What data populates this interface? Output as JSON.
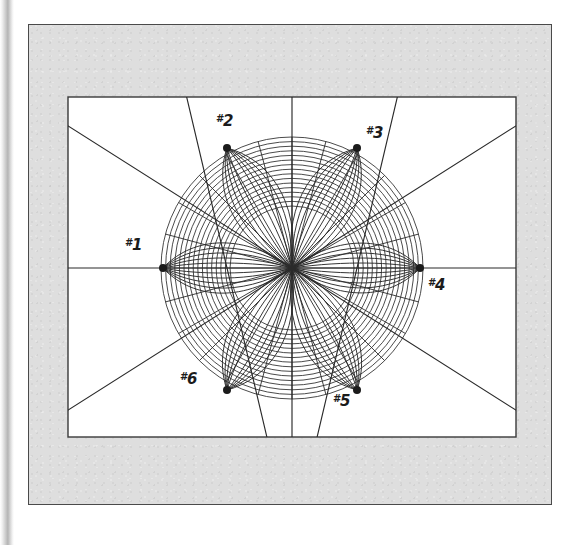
{
  "document": {
    "kind": "scanned-figure-plate",
    "background_color": "#ffffff",
    "plate_color": "#dedede",
    "canvas_color": "#ffffff",
    "ink_color": "#2a2a2a"
  },
  "plate": {
    "frame_label": "outer-plate-frame",
    "canvas_label": "figure-canvas"
  },
  "labels": [
    {
      "id": "n1",
      "hash": "#",
      "num": "1",
      "text": "#1"
    },
    {
      "id": "n2",
      "hash": "#",
      "num": "2",
      "text": "#2"
    },
    {
      "id": "n3",
      "hash": "#",
      "num": "3",
      "text": "#3"
    },
    {
      "id": "n4",
      "hash": "#",
      "num": "4",
      "text": "#4"
    },
    {
      "id": "n5",
      "hash": "#",
      "num": "5",
      "text": "#5"
    },
    {
      "id": "n6",
      "hash": "#",
      "num": "6",
      "text": "#6"
    }
  ],
  "chart_data": {
    "type": "scatter",
    "title": "",
    "xlabel": "",
    "ylabel": "",
    "grid": false,
    "legend": null,
    "center": {
      "x": 292,
      "y": 268
    },
    "inner_radius": 62,
    "outer_radius": 131,
    "ring_count": 16,
    "ring_color": "#2a2a2a",
    "chord_count": 24,
    "node_marker_radius": 4,
    "nodes": [
      {
        "name": "#1",
        "x": 163,
        "y": 268,
        "angle_deg": 180,
        "label_x": 125,
        "label_y": 236
      },
      {
        "name": "#2",
        "x": 227,
        "y": 148,
        "angle_deg": 118,
        "label_x": 216,
        "label_y": 112
      },
      {
        "name": "#3",
        "x": 357,
        "y": 148,
        "angle_deg": 62,
        "label_x": 366,
        "label_y": 124
      },
      {
        "name": "#4",
        "x": 420,
        "y": 268,
        "angle_deg": 0,
        "label_x": 428,
        "label_y": 276
      },
      {
        "name": "#5",
        "x": 357,
        "y": 390,
        "angle_deg": -62,
        "label_x": 333,
        "label_y": 392
      },
      {
        "name": "#6",
        "x": 227,
        "y": 390,
        "angle_deg": -118,
        "label_x": 180,
        "label_y": 370
      }
    ],
    "axis_lines": [
      {
        "name": "horizontal-axis",
        "x1": 52,
        "y1": 268,
        "x2": 532,
        "y2": 268
      },
      {
        "name": "vertical-axis",
        "x1": 292,
        "y1": 88,
        "x2": 292,
        "y2": 448
      },
      {
        "name": "diagonal-nw-se",
        "x1": 62,
        "y1": 122,
        "x2": 522,
        "y2": 414
      },
      {
        "name": "diagonal-sw-ne",
        "x1": 62,
        "y1": 414,
        "x2": 522,
        "y2": 122
      },
      {
        "name": "steep-nne-ssw",
        "x1": 185,
        "y1": 90,
        "x2": 269,
        "y2": 446
      },
      {
        "name": "steep-nnw-sse",
        "x1": 399,
        "y1": 90,
        "x2": 315,
        "y2": 446
      }
    ],
    "canvas_rect": {
      "x": 68,
      "y": 97,
      "width": 448,
      "height": 340
    },
    "plate_rect": {
      "x": 28,
      "y": 24,
      "width": 524,
      "height": 481
    }
  }
}
